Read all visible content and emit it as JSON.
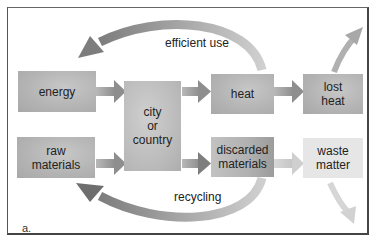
{
  "figure": {
    "label": "a.",
    "nodes": {
      "energy": "energy",
      "raw_materials_1": "raw",
      "raw_materials_2": "materials",
      "city_1": "city",
      "city_2": "or",
      "city_3": "country",
      "heat": "heat",
      "lost_heat_1": "lost",
      "lost_heat_2": "heat",
      "discarded_1": "discarded",
      "discarded_2": "materials",
      "waste_1": "waste",
      "waste_2": "matter"
    },
    "edges": {
      "efficient_use": "efficient use",
      "recycling": "recycling"
    },
    "colors": {
      "box_gray": "#b5b5b5",
      "box_light": "#e6e6e6",
      "arrow_dark": "#8a8a8a",
      "arrow_light": "#c8c8c8",
      "border": "#444444"
    }
  }
}
